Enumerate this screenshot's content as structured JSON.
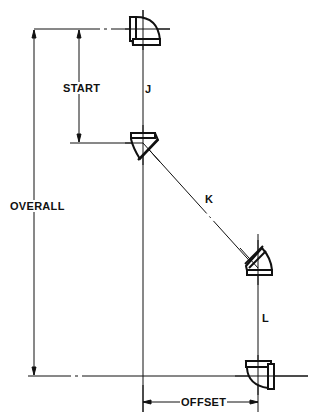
{
  "diagram": {
    "type": "pipe-offset-dimension-drawing",
    "labels": {
      "start": "START",
      "overall": "OVERALL",
      "offset": "OFFSET",
      "segment_j": "J",
      "segment_k": "K",
      "segment_l": "L"
    },
    "fittings": [
      {
        "name": "top-90-elbow"
      },
      {
        "name": "upper-45-elbow"
      },
      {
        "name": "lower-45-elbow"
      },
      {
        "name": "bottom-90-elbow"
      }
    ],
    "colors": {
      "line": "#111111",
      "background": "#ffffff"
    }
  }
}
